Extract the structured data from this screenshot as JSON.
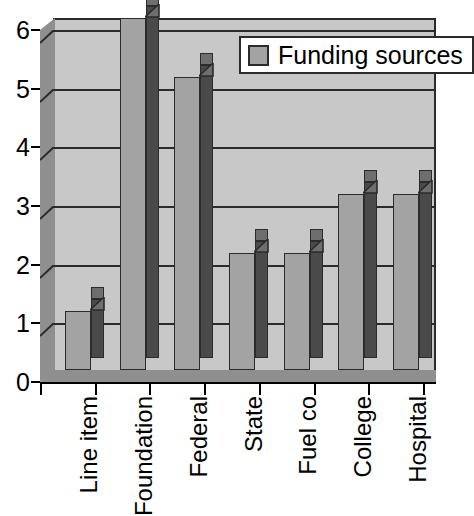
{
  "chart_data": {
    "type": "bar",
    "title": "",
    "subtitle": "",
    "xlabel": "",
    "ylabel": "",
    "categories": [
      "Line item",
      "Foundation",
      "Federal",
      "State",
      "Fuel co",
      "College",
      "Hospital"
    ],
    "values": [
      1,
      6,
      5,
      2,
      2,
      3,
      3
    ],
    "series": [
      {
        "name": "Funding sources",
        "values": [
          1,
          6,
          5,
          2,
          2,
          3,
          3
        ]
      }
    ],
    "ylim": [
      0,
      6
    ],
    "xlim": [
      0,
      7
    ],
    "y_ticks": [
      "0",
      "1",
      "2",
      "3",
      "4",
      "5",
      "6"
    ],
    "y_tick_values": [
      0,
      1,
      2,
      3,
      4,
      5,
      6
    ],
    "grid": true,
    "grid_axis": "y",
    "legend": {
      "position": "top-right",
      "entries": [
        "Funding sources"
      ]
    },
    "style": "3d-column",
    "annotations": []
  },
  "legend": {
    "label": "Funding sources",
    "swatch_name": "legend-swatch-funding-sources"
  },
  "colors": {
    "plot_background": "#c8c8c8",
    "bar_front": "#a3a3a3",
    "bar_side": "#4a4a4a",
    "bar_top": "#6e6e6e",
    "wall_side": "#8f8f8f",
    "axis": "#000000",
    "gridline": "#2b2b2b",
    "legend_background": "#ffffff",
    "page_background": "#ffffff"
  }
}
